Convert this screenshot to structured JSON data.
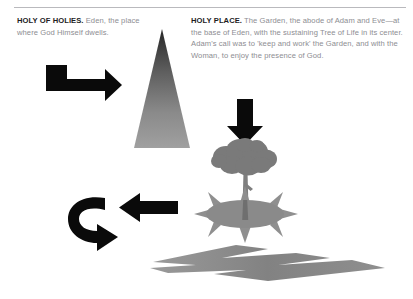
{
  "page": {
    "background_color": "#ffffff",
    "rule_color": "#b9b9bd"
  },
  "captions": {
    "left": {
      "heading": "HOLY OF HOLIES.",
      "body": " Eden, the place where God Himself dwells."
    },
    "right": {
      "heading": "HOLY PLACE.",
      "body": " The Garden, the abode of Adam and Eve—at the base of Eden, with the sustaining Tree of Life in its center. Adam's call was to 'keep and work' the Garden, and with the Woman, to enjoy the presence of God."
    }
  },
  "colors": {
    "heading_text": "#1d1d1f",
    "body_text": "#8d8d92",
    "arrow_black": "#0a0a0a",
    "gray_fill": "#8a8a8a",
    "gray_light": "#9d9d9d",
    "triangle_top": "#2e2e2e",
    "triangle_bottom": "#9b9b9b"
  },
  "figures": [
    {
      "name": "mountain-triangle",
      "label": "Eden mountain",
      "shading": "vertical gradient dark apex to light base"
    },
    {
      "name": "elbow-arrow-right",
      "label": "arrow pointing right to mountain"
    },
    {
      "name": "down-arrow",
      "label": "arrow pointing down to tree"
    },
    {
      "name": "tree-of-life",
      "label": "Tree of Life with cloud canopy and trunk"
    },
    {
      "name": "radiant-garden",
      "label": "garden ellipse with radiating rays"
    },
    {
      "name": "left-arrow",
      "label": "arrow pointing left"
    },
    {
      "name": "curved-arrow",
      "label": "curved arrow turning down and left"
    },
    {
      "name": "river-lightning",
      "label": "river flowing from Eden"
    }
  ]
}
